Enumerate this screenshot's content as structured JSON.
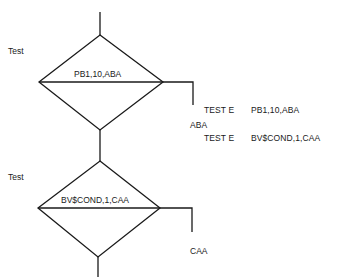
{
  "diagram": {
    "type": "flowchart",
    "nodes": [
      {
        "id": "decision1",
        "shape": "diamond",
        "side_label": "Test",
        "content": "PB1,10,ABA"
      },
      {
        "id": "decision2",
        "shape": "diamond",
        "side_label": "Test",
        "content": "BV$COND,1,CAA"
      }
    ],
    "branch_labels": {
      "decision2_right": "CAA"
    },
    "code": {
      "line1": {
        "op": "TEST E",
        "args": "PB1,10,ABA"
      },
      "label_line": "ABA",
      "line2": {
        "op": "TEST E",
        "args": "BV$COND,1,CAA"
      }
    },
    "colors": {
      "line": "#1a1a1a",
      "background": "#ffffff"
    }
  }
}
